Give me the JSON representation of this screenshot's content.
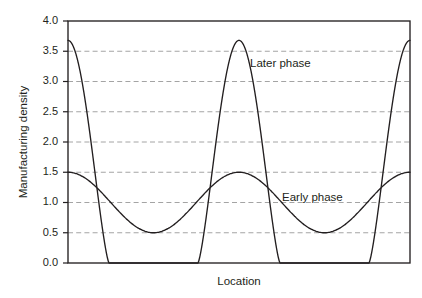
{
  "chart_data": {
    "type": "line",
    "title": "",
    "xlabel": "Location",
    "ylabel": "Manufacturing density",
    "ylim": [
      0.0,
      4.0
    ],
    "xlim": [
      0.0,
      2.0
    ],
    "grid": true,
    "legend_position": "inline-annotation",
    "y_ticks": [
      "0.0",
      "0.5",
      "1.0",
      "1.5",
      "2.0",
      "2.5",
      "3.0",
      "3.5",
      "4.0"
    ],
    "y_tick_values": [
      0.0,
      0.5,
      1.0,
      1.5,
      2.0,
      2.5,
      3.0,
      3.5,
      4.0
    ],
    "x_ticks": [],
    "x_tick_values": [],
    "annotations": [
      {
        "text": "Later phase",
        "x": 1.06,
        "y": 3.25
      },
      {
        "text": "Early phase",
        "x": 1.42,
        "y": 1.18
      }
    ],
    "series": [
      {
        "name": "Early phase",
        "description": "Smooth cosine wave oscillating between 0.5 and 1.5, period 1.0 location units, peaks at location 0.0, 1.0 and 2.0, troughs at 0.5 and 1.5",
        "mean": 1.0,
        "amplitude": 0.5,
        "period": 1.0,
        "min": 0.5,
        "max": 1.5,
        "x": [
          0.0,
          0.05,
          0.1,
          0.15,
          0.2,
          0.25,
          0.3,
          0.35,
          0.4,
          0.45,
          0.5,
          0.55,
          0.6,
          0.65,
          0.7,
          0.75,
          0.8,
          0.85,
          0.9,
          0.95,
          1.0,
          1.05,
          1.1,
          1.15,
          1.2,
          1.25,
          1.3,
          1.35,
          1.4,
          1.45,
          1.5,
          1.55,
          1.6,
          1.65,
          1.7,
          1.75,
          1.8,
          1.85,
          1.9,
          1.95,
          2.0
        ],
        "values": [
          1.5,
          1.488,
          1.452,
          1.397,
          1.325,
          1.25,
          1.175,
          1.103,
          1.048,
          1.012,
          1.0,
          1.012,
          1.048,
          1.103,
          1.175,
          1.25,
          1.325,
          1.397,
          1.452,
          1.488,
          1.5,
          1.488,
          1.452,
          1.397,
          1.325,
          1.25,
          1.175,
          1.103,
          1.048,
          1.012,
          1.0,
          1.012,
          1.048,
          1.103,
          1.175,
          1.25,
          1.325,
          1.397,
          1.452,
          1.488,
          1.5
        ]
      },
      {
        "name": "Later phase",
        "description": "Sharply peaked periodic curve, peaks of 3.68 at location 0.0, 1.0 and 2.0, flat at 0.0 between about location 0.24 and 0.82 in each period",
        "period": 1.0,
        "min": 0.0,
        "max": 3.68,
        "zero_band_half_width": 0.26,
        "x": [
          0.0,
          0.04,
          0.08,
          0.12,
          0.16,
          0.2,
          0.235,
          0.26,
          0.5,
          0.74,
          0.765,
          0.8,
          0.84,
          0.88,
          0.92,
          0.96,
          1.0,
          1.04,
          1.08,
          1.12,
          1.16,
          1.2,
          1.235,
          1.26,
          1.5,
          1.74,
          1.765,
          1.8,
          1.84,
          1.88,
          1.92,
          1.96,
          2.0
        ],
        "values": [
          3.68,
          3.6,
          3.35,
          2.86,
          2.1,
          1.05,
          0.0,
          0.0,
          0.0,
          0.0,
          0.0,
          0.22,
          1.05,
          2.1,
          2.86,
          3.35,
          3.68,
          3.35,
          2.86,
          2.1,
          1.05,
          0.22,
          0.0,
          0.0,
          0.0,
          0.0,
          0.0,
          0.22,
          1.05,
          2.1,
          2.86,
          3.35,
          3.68
        ]
      }
    ]
  },
  "figure": {
    "y_axis_title": "Manufacturing density",
    "x_axis_title": "Location",
    "y_labels": [
      "4.0",
      "3.5",
      "3.0",
      "2.5",
      "2.0",
      "1.5",
      "1.0",
      "0.5",
      "0.0"
    ],
    "later_phase_label": "Later phase",
    "early_phase_label": "Early phase",
    "colors": {
      "curve": "#231f20",
      "grid": "#9a9a9a",
      "axis": "#231f20",
      "text": "#231f20",
      "background": "#ffffff"
    }
  }
}
